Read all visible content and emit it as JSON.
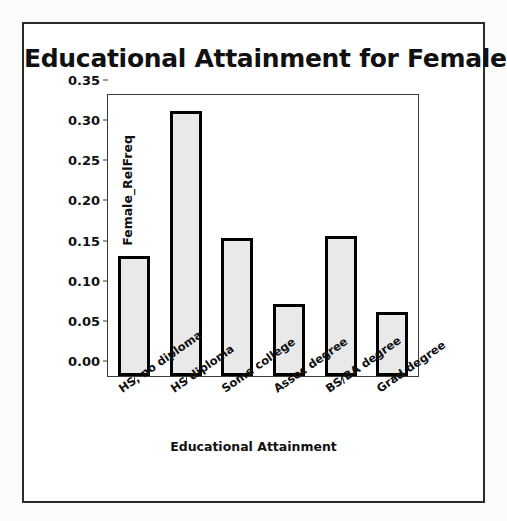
{
  "figure": {
    "title": "Educational Attainment for Females"
  },
  "chart_data": {
    "type": "bar",
    "title": "Educational Attainment for Females",
    "xlabel": "Educational Attainment",
    "ylabel": "Female_RelFreq",
    "categories": [
      "HS, no diploma",
      "HS diploma",
      "Some college",
      "Assoc degree",
      "BS/BA degree",
      "Grad degree"
    ],
    "values": [
      0.15,
      0.33,
      0.172,
      0.09,
      0.175,
      0.08
    ],
    "ylim": [
      0.0,
      0.35
    ],
    "ytick_labels": [
      "0.00",
      "0.05",
      "0.10",
      "0.15",
      "0.20",
      "0.25",
      "0.30",
      "0.35"
    ],
    "ytick_values": [
      0.0,
      0.05,
      0.1,
      0.15,
      0.2,
      0.25,
      0.3,
      0.35
    ],
    "grid": false,
    "legend": false,
    "bar_fill_color": "#e9e9e9",
    "bar_edge_color": "#000000"
  }
}
